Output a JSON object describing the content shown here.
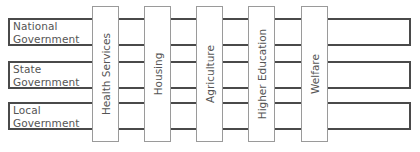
{
  "diagram": {
    "type": "matrix-grid",
    "rows": [
      {
        "label_line1": "National",
        "label_line2": "Government"
      },
      {
        "label_line1": "State",
        "label_line2": "Government"
      },
      {
        "label_line1": "Local",
        "label_line2": "Government"
      }
    ],
    "columns": [
      {
        "label": "Health Services"
      },
      {
        "label": "Housing"
      },
      {
        "label": "Agriculture"
      },
      {
        "label": "Higher Education"
      },
      {
        "label": "Welfare"
      }
    ],
    "colors": {
      "row_border": "#4a4a4a",
      "column_border": "#9a9a9a",
      "text": "#555555",
      "background": "#ffffff"
    }
  }
}
